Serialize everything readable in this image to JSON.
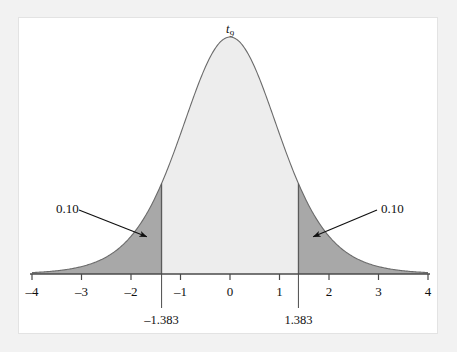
{
  "figure": {
    "curve_label": "t",
    "curve_label_sub": "9",
    "distribution": "t distribution with 9 degrees of freedom",
    "colors": {
      "page_background": "#f2f2f2",
      "card_background": "#ffffff",
      "center_fill": "#ededed",
      "tail_fill": "#a8a8a8",
      "curve_stroke": "#6b6b6b",
      "axis_stroke": "#4a4a4a",
      "text": "#101010"
    }
  },
  "chart_data": {
    "type": "area",
    "title": "",
    "subtitle": "",
    "xlabel": "",
    "ylabel": "",
    "xlim": [
      -4,
      4
    ],
    "ylim": [
      0,
      0.39
    ],
    "grid": false,
    "legend": null,
    "series_label": "t₉ density",
    "degrees_of_freedom": 9,
    "xticks": [
      -4,
      -3,
      -2,
      -1,
      0,
      1,
      2,
      3,
      4
    ],
    "xtick_labels": [
      "–4",
      "–3",
      "–2",
      "–1",
      "0",
      "1",
      "2",
      "3",
      "4"
    ],
    "critical_values": [
      -1.383,
      1.383
    ],
    "critical_value_labels": [
      "–1.383",
      "1.383"
    ],
    "tail_areas": [
      0.1,
      0.1
    ],
    "tail_area_labels": [
      "0.10",
      "0.10"
    ],
    "annotations": [
      {
        "text": "0.10",
        "target_x": -1.75,
        "side": "left"
      },
      {
        "text": "0.10",
        "target_x": 1.75,
        "side": "right"
      }
    ],
    "shaded_regions": [
      {
        "name": "left-tail",
        "from": -4,
        "to": -1.383,
        "area": 0.1,
        "fill": "#a8a8a8"
      },
      {
        "name": "center",
        "from": -1.383,
        "to": 1.383,
        "area": 0.8,
        "fill": "#ededed"
      },
      {
        "name": "right-tail",
        "from": 1.383,
        "to": 4,
        "area": 0.1,
        "fill": "#a8a8a8"
      }
    ]
  },
  "axis": {
    "tick_0": "–4",
    "tick_1": "–3",
    "tick_2": "–2",
    "tick_3": "–1",
    "tick_4": "0",
    "tick_5": "1",
    "tick_6": "2",
    "tick_7": "3",
    "tick_8": "4"
  },
  "labels": {
    "left_bound": "–1.383",
    "right_bound": "1.383",
    "left_area": "0.10",
    "right_area": "0.10"
  }
}
